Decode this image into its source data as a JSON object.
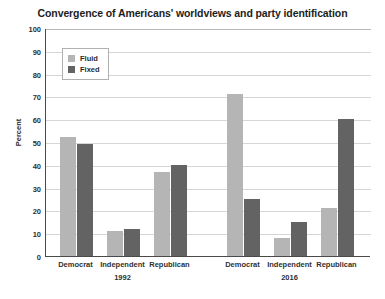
{
  "chart_data": {
    "type": "bar",
    "title": "Convergence of Americans' worldviews and party identification",
    "xlabel": "",
    "ylabel": "Percent",
    "ylim": [
      0,
      100
    ],
    "y_ticks": [
      0,
      10,
      20,
      30,
      40,
      50,
      60,
      70,
      80,
      90,
      100
    ],
    "grid": true,
    "legend_position": "upper-left-inside",
    "groups": [
      "1992",
      "2016"
    ],
    "categories": [
      "Democrat",
      "Independent",
      "Republican",
      "Democrat",
      "Independent",
      "Republican"
    ],
    "series": [
      {
        "name": "Fluid",
        "color": "#b5b5b5",
        "values": [
          52,
          11,
          37,
          71,
          8,
          21
        ]
      },
      {
        "name": "Fixed",
        "color": "#636363",
        "values": [
          49,
          12,
          40,
          25,
          15,
          60
        ]
      }
    ]
  },
  "legend": {
    "items": [
      {
        "label": "Fluid",
        "swatch": "fluid"
      },
      {
        "label": "Fixed",
        "swatch": "fixed"
      }
    ]
  },
  "axis": {
    "y_title": "Percent",
    "y_tick_labels": [
      "100",
      "90",
      "80",
      "70",
      "60",
      "50",
      "40",
      "30",
      "20",
      "10",
      "0"
    ]
  },
  "x_axis": {
    "category_labels": [
      "Democrat",
      "Independent",
      "Republican",
      "Democrat",
      "Independent",
      "Republican"
    ],
    "group_labels": [
      "1992",
      "2016"
    ]
  }
}
